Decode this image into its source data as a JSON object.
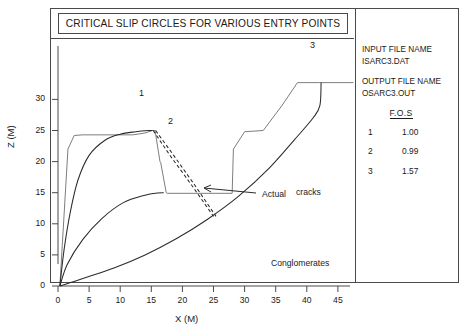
{
  "chart_data": {
    "type": "line",
    "title": "CRITICAL SLIP CIRCLES FOR VARIOUS ENTRY POINTS",
    "xlabel": "X (M)",
    "ylabel": "Z (M)",
    "xlim": [
      0,
      48
    ],
    "ylim": [
      0,
      35
    ],
    "xticks": [
      0,
      5,
      10,
      15,
      20,
      25,
      30,
      35,
      40,
      45
    ],
    "yticks": [
      0,
      5,
      10,
      15,
      20,
      25,
      30
    ],
    "grid": false,
    "legend_position": "right-panel",
    "series": [
      {
        "name": "ground-profile",
        "style": "solid-thin",
        "points": [
          [
            0.3,
            0.0
          ],
          [
            1.6,
            22.0
          ],
          [
            2.6,
            24.2
          ],
          [
            4.0,
            24.3
          ],
          [
            12.0,
            24.3
          ],
          [
            14.0,
            24.6
          ],
          [
            15.2,
            25.0
          ],
          [
            15.6,
            25.0
          ],
          [
            16.4,
            20.0
          ],
          [
            16.5,
            19.9
          ],
          [
            17.4,
            15.0
          ],
          [
            17.6,
            14.9
          ],
          [
            28.0,
            14.9
          ],
          [
            28.2,
            22.0
          ],
          [
            30.0,
            24.8
          ],
          [
            33.0,
            25.0
          ],
          [
            36.0,
            29.0
          ],
          [
            38.5,
            32.7
          ],
          [
            42.0,
            32.7
          ],
          [
            47.5,
            32.7
          ]
        ]
      },
      {
        "name": "slip-circle-1",
        "label": "1",
        "fos": "1.00",
        "style": "solid",
        "entry": [
          15.2,
          25.0
        ],
        "points": [
          [
            0.3,
            0.0
          ],
          [
            1.0,
            6.0
          ],
          [
            2.0,
            12.0
          ],
          [
            3.2,
            17.0
          ],
          [
            5.0,
            21.0
          ],
          [
            7.5,
            23.4
          ],
          [
            10.0,
            24.4
          ],
          [
            12.5,
            24.8
          ],
          [
            14.6,
            25.0
          ],
          [
            15.2,
            25.0
          ]
        ]
      },
      {
        "name": "slip-circle-2",
        "label": "2",
        "fos": "0.99",
        "style": "solid",
        "entry": [
          17.0,
          15.0
        ],
        "points": [
          [
            0.3,
            0.0
          ],
          [
            1.5,
            3.5
          ],
          [
            4.0,
            7.5
          ],
          [
            7.0,
            10.8
          ],
          [
            10.5,
            13.4
          ],
          [
            14.0,
            14.6
          ],
          [
            16.0,
            14.95
          ],
          [
            17.0,
            15.0
          ]
        ]
      },
      {
        "name": "slip-circle-3",
        "label": "3",
        "fos": "1.57",
        "style": "solid",
        "entry": [
          42.3,
          32.7
        ],
        "points": [
          [
            0.3,
            0.0
          ],
          [
            4.0,
            1.2
          ],
          [
            9.0,
            2.9
          ],
          [
            14.0,
            5.0
          ],
          [
            19.0,
            7.6
          ],
          [
            24.0,
            10.7
          ],
          [
            29.0,
            14.4
          ],
          [
            34.0,
            19.0
          ],
          [
            38.0,
            23.5
          ],
          [
            41.0,
            27.0
          ],
          [
            42.1,
            29.0
          ],
          [
            42.3,
            32.7
          ]
        ]
      },
      {
        "name": "actual-crack-a",
        "style": "dashed",
        "points": [
          [
            15.3,
            25.0
          ],
          [
            18.0,
            21.0
          ],
          [
            21.5,
            16.2
          ],
          [
            25.0,
            11.2
          ]
        ]
      },
      {
        "name": "actual-crack-b",
        "style": "dashed",
        "points": [
          [
            15.7,
            25.0
          ],
          [
            18.6,
            21.0
          ],
          [
            22.0,
            16.2
          ],
          [
            25.4,
            11.2
          ]
        ]
      }
    ],
    "annotations": [
      {
        "name": "actual-cracks",
        "text": "Actual",
        "text2": "cracks",
        "points_to": [
          25.0,
          11.0
        ]
      },
      {
        "name": "conglomerates",
        "text": "Conglomerates",
        "at": [
          30.0,
          1.8
        ]
      },
      {
        "name": "curve-label-1",
        "text": "1",
        "at": [
          15.0,
          26.5
        ]
      },
      {
        "name": "curve-label-2",
        "text": "2",
        "at": [
          18.3,
          21.6
        ]
      },
      {
        "name": "curve-label-3",
        "text": "3",
        "at": [
          41.5,
          34.3
        ]
      }
    ]
  },
  "title_box": {
    "text": "CRITICAL SLIP CIRCLES FOR VARIOUS ENTRY POINTS"
  },
  "info_panel": {
    "input_label": "INPUT FILE NAME",
    "input_value": "ISARC3.DAT",
    "output_label": "OUTPUT FILE NAME",
    "output_value": "OSARC3.OUT",
    "fos_heading": "F.O.S",
    "fos_rows": [
      {
        "id": "1",
        "value": "1.00"
      },
      {
        "id": "2",
        "value": "0.99"
      },
      {
        "id": "3",
        "value": "1.57"
      }
    ]
  },
  "axes": {
    "x_title": "X (M)",
    "y_title": "Z (M)",
    "x_ticks": [
      "0",
      "5",
      "10",
      "15",
      "20",
      "25",
      "30",
      "35",
      "40",
      "45"
    ],
    "y_ticks": [
      "0",
      "5",
      "10",
      "15",
      "20",
      "25",
      "30"
    ]
  },
  "labels": {
    "curve1": "1",
    "curve2": "2",
    "curve3": "3",
    "actual": "Actual",
    "cracks": "cracks",
    "conglomerates": "Conglomerates"
  },
  "colors": {
    "frame": "#4a4a4a",
    "curve": "#2b2b2b",
    "terrain": "#6e6e6e",
    "text": "#1a1a1a"
  }
}
